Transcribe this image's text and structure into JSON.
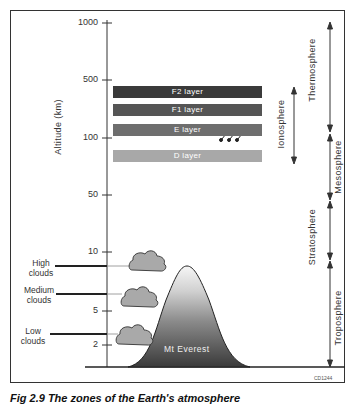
{
  "figure": {
    "caption": "Fig 2.9 The zones of the Earth's atmosphere",
    "code": "CD1244",
    "y_axis_label": "Altitude (km)"
  },
  "axis": {
    "ticks": [
      {
        "label": "1000",
        "y": 23
      },
      {
        "label": "500",
        "y": 80
      },
      {
        "label": "100",
        "y": 138
      },
      {
        "label": "50",
        "y": 195
      },
      {
        "label": "10",
        "y": 252
      },
      {
        "label": "5",
        "y": 311
      },
      {
        "label": "2",
        "y": 345
      }
    ]
  },
  "layers": [
    {
      "label": "F2 layer",
      "color": "#3a3a3a"
    },
    {
      "label": "F1 layer",
      "color": "#555555"
    },
    {
      "label": "E layer",
      "color": "#6e6e6e"
    },
    {
      "label": "D layer",
      "color": "#a8a8a8"
    }
  ],
  "ionosphere": {
    "label": "Ionosphere"
  },
  "zones": [
    {
      "label": "Thermosphere"
    },
    {
      "label": "Mesosphere"
    },
    {
      "label": "Stratosphere"
    },
    {
      "label": "Troposphere"
    }
  ],
  "clouds": [
    {
      "label_line1": "High",
      "label_line2": "clouds"
    },
    {
      "label_line1": "Medium",
      "label_line2": "clouds"
    },
    {
      "label_line1": "Low",
      "label_line2": "clouds"
    }
  ],
  "mountain": {
    "label": "Mt Everest"
  },
  "colors": {
    "cloud_fill": "#a9a9a9",
    "mountain_top": "#f4f4f4",
    "mountain_bottom": "#3d3d3d"
  }
}
